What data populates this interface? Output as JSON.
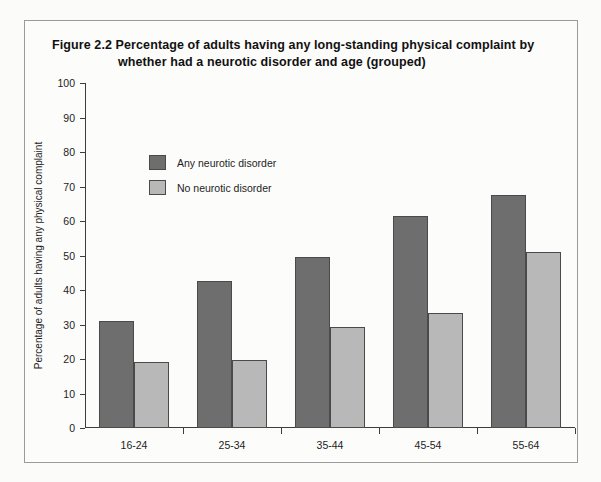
{
  "figure": {
    "number": "Figure 2.2",
    "title_line_1": "Figure 2.2  Percentage of adults having any long-standing physical complaint by",
    "title_line_2": "whether had a neurotic disorder and age (grouped)"
  },
  "legend": {
    "items": [
      {
        "label": "Any neurotic disorder",
        "color": "#6e6e6e",
        "key": "any-neurotic-disorder"
      },
      {
        "label": "No neurotic disorder",
        "color": "#b8b8b8",
        "key": "no-neurotic-disorder"
      }
    ]
  },
  "axes": {
    "y_title": "Percentage of adults having any physical complaint",
    "y_ticks": [
      "0",
      "10",
      "20",
      "30",
      "40",
      "50",
      "60",
      "70",
      "80",
      "90",
      "100"
    ],
    "x_title": ""
  },
  "chart_data": {
    "type": "bar",
    "title": "Percentage of adults having any long-standing physical complaint by whether had a neurotic disorder and age (grouped)",
    "xlabel": "",
    "ylabel": "Percentage of adults having any physical complaint",
    "ylim": [
      0,
      100
    ],
    "ytick_step": 10,
    "grid": false,
    "legend_position": "top-left inside plot",
    "categories": [
      "16-24",
      "25-34",
      "35-44",
      "45-54",
      "55-64"
    ],
    "series": [
      {
        "name": "Any neurotic disorder",
        "color": "#6e6e6e",
        "values": [
          31.0,
          42.5,
          49.5,
          61.5,
          67.5
        ]
      },
      {
        "name": "No neurotic disorder",
        "color": "#b8b8b8",
        "values": [
          19.0,
          19.7,
          29.4,
          33.4,
          51.0
        ]
      }
    ]
  }
}
